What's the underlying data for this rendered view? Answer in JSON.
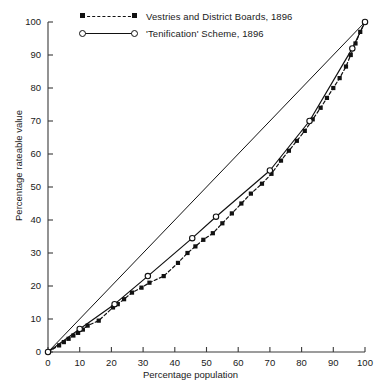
{
  "chart_data": {
    "type": "line",
    "title": "",
    "subtitle": "",
    "xlabel": "Percentage population",
    "ylabel": "Percentage rateable value",
    "xlim": [
      0,
      100
    ],
    "ylim": [
      0,
      100
    ],
    "xticks": [
      0,
      10,
      20,
      30,
      40,
      50,
      60,
      70,
      80,
      90,
      100
    ],
    "yticks": [
      0,
      10,
      20,
      30,
      40,
      50,
      60,
      70,
      80,
      90,
      100
    ],
    "grid": false,
    "legend_position": "top-left",
    "reference_line": {
      "name": "line of equality",
      "x": [
        0,
        100
      ],
      "y": [
        0,
        100
      ],
      "style": "solid",
      "color": "#111111"
    },
    "series": [
      {
        "name": "Vestries and District Boards, 1896",
        "marker": "filled-square",
        "line_style": "dashed",
        "color": "#111111",
        "points": [
          {
            "x": 0.0,
            "y": 0.0
          },
          {
            "x": 3.5,
            "y": 2.0
          },
          {
            "x": 5.0,
            "y": 3.0
          },
          {
            "x": 6.5,
            "y": 4.0
          },
          {
            "x": 8.0,
            "y": 5.0
          },
          {
            "x": 9.5,
            "y": 5.8
          },
          {
            "x": 11.0,
            "y": 6.8
          },
          {
            "x": 12.5,
            "y": 8.0
          },
          {
            "x": 16.0,
            "y": 9.5
          },
          {
            "x": 20.5,
            "y": 13.5
          },
          {
            "x": 22.0,
            "y": 14.5
          },
          {
            "x": 24.0,
            "y": 16.0
          },
          {
            "x": 26.5,
            "y": 18.0
          },
          {
            "x": 29.5,
            "y": 19.5
          },
          {
            "x": 32.0,
            "y": 21.0
          },
          {
            "x": 36.5,
            "y": 23.0
          },
          {
            "x": 41.0,
            "y": 27.0
          },
          {
            "x": 44.0,
            "y": 30.0
          },
          {
            "x": 46.5,
            "y": 32.0
          },
          {
            "x": 49.0,
            "y": 34.0
          },
          {
            "x": 52.0,
            "y": 36.0
          },
          {
            "x": 55.0,
            "y": 39.0
          },
          {
            "x": 58.0,
            "y": 42.0
          },
          {
            "x": 61.0,
            "y": 45.0
          },
          {
            "x": 64.0,
            "y": 48.0
          },
          {
            "x": 67.5,
            "y": 51.0
          },
          {
            "x": 70.5,
            "y": 54.0
          },
          {
            "x": 73.5,
            "y": 58.0
          },
          {
            "x": 76.0,
            "y": 61.0
          },
          {
            "x": 78.5,
            "y": 64.0
          },
          {
            "x": 81.0,
            "y": 67.0
          },
          {
            "x": 83.5,
            "y": 70.5
          },
          {
            "x": 86.0,
            "y": 74.0
          },
          {
            "x": 88.0,
            "y": 77.0
          },
          {
            "x": 90.0,
            "y": 80.0
          },
          {
            "x": 92.0,
            "y": 83.0
          },
          {
            "x": 94.0,
            "y": 86.5
          },
          {
            "x": 95.5,
            "y": 90.0
          },
          {
            "x": 97.0,
            "y": 93.5
          },
          {
            "x": 98.5,
            "y": 97.0
          },
          {
            "x": 100.0,
            "y": 100.0
          }
        ]
      },
      {
        "name": "'Tenification' Scheme, 1896",
        "marker": "open-circle",
        "line_style": "solid",
        "color": "#111111",
        "points": [
          {
            "x": 0.0,
            "y": 0.0
          },
          {
            "x": 10.0,
            "y": 7.0
          },
          {
            "x": 21.0,
            "y": 14.5
          },
          {
            "x": 31.5,
            "y": 23.0
          },
          {
            "x": 45.5,
            "y": 34.5
          },
          {
            "x": 53.0,
            "y": 41.0
          },
          {
            "x": 70.0,
            "y": 55.0
          },
          {
            "x": 82.5,
            "y": 70.0
          },
          {
            "x": 96.0,
            "y": 92.0
          },
          {
            "x": 100.0,
            "y": 100.0
          }
        ]
      }
    ],
    "legend": [
      {
        "label": "Vestries and District Boards, 1896",
        "marker": "filled-square",
        "line_style": "dashed"
      },
      {
        "label": "'Tenification' Scheme, 1896",
        "marker": "open-circle",
        "line_style": "solid"
      }
    ]
  }
}
